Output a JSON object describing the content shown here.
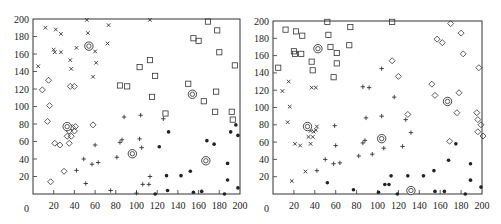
{
  "chart_data": [
    {
      "type": "scatter",
      "title": "",
      "xlabel": "",
      "ylabel": "",
      "xlim": [
        0,
        200
      ],
      "ylim": [
        0,
        200
      ],
      "xticks": [
        "0",
        "20",
        "40",
        "60",
        "80",
        "100",
        "120",
        "140",
        "160",
        "180",
        "200"
      ],
      "yticks": [
        "20",
        "40",
        "60",
        "80",
        "100",
        "120",
        "140",
        "160",
        "180",
        "200"
      ],
      "grid": false,
      "legend": null,
      "series": [
        {
          "name": "cluster-x",
          "marker": "x",
          "points": [
            [
              5,
              146
            ],
            [
              12,
              190
            ],
            [
              20,
              165
            ],
            [
              21,
              162
            ],
            [
              22,
              188
            ],
            [
              27,
              162
            ],
            [
              27,
              183
            ],
            [
              36,
              153
            ],
            [
              37,
              143
            ],
            [
              42,
              167
            ],
            [
              52,
              199
            ],
            [
              53,
              184
            ],
            [
              58,
              134
            ],
            [
              60,
              163
            ],
            [
              61,
              150
            ],
            [
              72,
              172
            ],
            [
              73,
              193
            ],
            [
              113,
              199
            ]
          ]
        },
        {
          "name": "cluster-diamond",
          "marker": "diamond",
          "points": [
            [
              9,
              119
            ],
            [
              15,
              130
            ],
            [
              14,
              83
            ],
            [
              16,
              101
            ],
            [
              17,
              14
            ],
            [
              21,
              58
            ],
            [
              26,
              56
            ],
            [
              30,
              26
            ],
            [
              33,
              66
            ],
            [
              35,
              58
            ],
            [
              35,
              72
            ],
            [
              36,
              123
            ],
            [
              37,
              66
            ],
            [
              38,
              76
            ],
            [
              40,
              123
            ],
            [
              40,
              72
            ],
            [
              41,
              77
            ],
            [
              58,
              79
            ]
          ]
        },
        {
          "name": "cluster-square",
          "marker": "square",
          "points": [
            [
              84,
              124
            ],
            [
              91,
              123
            ],
            [
              103,
              145
            ],
            [
              113,
              153
            ],
            [
              115,
              111
            ],
            [
              118,
              135
            ],
            [
              128,
              92
            ],
            [
              150,
              126
            ],
            [
              155,
              178
            ],
            [
              160,
              175
            ],
            [
              165,
              106
            ],
            [
              169,
              197
            ],
            [
              176,
              94
            ],
            [
              177,
              117
            ],
            [
              178,
              187
            ],
            [
              180,
              162
            ],
            [
              192,
              94
            ],
            [
              193,
              85
            ],
            [
              195,
              147
            ]
          ]
        },
        {
          "name": "cluster-plus",
          "marker": "plus",
          "points": [
            [
              42,
              27
            ],
            [
              49,
              40
            ],
            [
              51,
              12
            ],
            [
              57,
              34
            ],
            [
              60,
              56
            ],
            [
              63,
              36
            ],
            [
              75,
              4
            ],
            [
              81,
              42
            ],
            [
              84,
              59
            ],
            [
              86,
              62
            ],
            [
              88,
              88
            ],
            [
              100,
              1
            ],
            [
              103,
              63
            ],
            [
              104,
              90
            ],
            [
              105,
              53
            ],
            [
              106,
              11
            ],
            [
              112,
              11
            ],
            [
              113,
              20
            ],
            [
              126,
              86
            ]
          ]
        },
        {
          "name": "cluster-dot",
          "marker": "dot",
          "points": [
            [
              118,
              0
            ],
            [
              122,
              54
            ],
            [
              129,
              21
            ],
            [
              130,
              4
            ],
            [
              131,
              71
            ],
            [
              143,
              21
            ],
            [
              152,
              26
            ],
            [
              155,
              2
            ],
            [
              163,
              3
            ],
            [
              168,
              61
            ],
            [
              175,
              57
            ],
            [
              185,
              0
            ],
            [
              188,
              35
            ],
            [
              188,
              16
            ],
            [
              191,
              71
            ],
            [
              196,
              79
            ],
            [
              198,
              67
            ],
            [
              198,
              7
            ]
          ]
        },
        {
          "name": "centroids",
          "marker": "circled",
          "points": [
            [
              54,
              169
            ],
            [
              33,
              77
            ],
            [
              96,
              46
            ],
            [
              154,
              114
            ],
            [
              167,
              38
            ]
          ]
        }
      ]
    },
    {
      "type": "scatter",
      "title": "",
      "xlabel": "",
      "ylabel": "",
      "xlim": [
        0,
        200
      ],
      "ylim": [
        0,
        200
      ],
      "xticks": [
        "0",
        "20",
        "40",
        "60",
        "80",
        "100",
        "120",
        "140",
        "160",
        "180",
        "200"
      ],
      "yticks": [
        "20",
        "40",
        "60",
        "80",
        "100",
        "120",
        "140",
        "160",
        "180",
        "200"
      ],
      "grid": false,
      "legend": null,
      "series": [
        {
          "name": "cluster-square",
          "marker": "square",
          "points": [
            [
              5,
              146
            ],
            [
              12,
              190
            ],
            [
              20,
              165
            ],
            [
              21,
              162
            ],
            [
              22,
              188
            ],
            [
              27,
              162
            ],
            [
              28,
              183
            ],
            [
              37,
              153
            ],
            [
              38,
              143
            ],
            [
              52,
              199
            ],
            [
              53,
              184
            ],
            [
              55,
              170
            ],
            [
              58,
              135
            ],
            [
              61,
              163
            ],
            [
              61,
              151
            ],
            [
              73,
              172
            ],
            [
              74,
              193
            ],
            [
              114,
              199
            ]
          ]
        },
        {
          "name": "cluster-x",
          "marker": "x",
          "points": [
            [
              9,
              119
            ],
            [
              15,
              130
            ],
            [
              14,
              83
            ],
            [
              16,
              101
            ],
            [
              18,
              15
            ],
            [
              21,
              58
            ],
            [
              26,
              56
            ],
            [
              31,
              26
            ],
            [
              34,
              66
            ],
            [
              36,
              58
            ],
            [
              36,
              73
            ],
            [
              37,
              123
            ],
            [
              38,
              66
            ],
            [
              39,
              72
            ],
            [
              41,
              123
            ],
            [
              41,
              74
            ],
            [
              42,
              78
            ]
          ]
        },
        {
          "name": "cluster-plus",
          "marker": "plus",
          "points": [
            [
              42,
              27
            ],
            [
              50,
              40
            ],
            [
              58,
              35
            ],
            [
              59,
              79
            ],
            [
              60,
              56
            ],
            [
              64,
              36
            ],
            [
              82,
              44
            ],
            [
              86,
              59
            ],
            [
              86,
              124
            ],
            [
              88,
              62
            ],
            [
              89,
              88
            ],
            [
              92,
              123
            ],
            [
              95,
              46
            ],
            [
              104,
              145
            ],
            [
              104,
              90
            ],
            [
              106,
              53
            ],
            [
              116,
              112
            ],
            [
              124,
              55
            ],
            [
              127,
              86
            ],
            [
              132,
              71
            ]
          ]
        },
        {
          "name": "cluster-diamond",
          "marker": "diamond",
          "points": [
            [
              114,
              154
            ],
            [
              120,
              136
            ],
            [
              129,
              92
            ],
            [
              152,
              127
            ],
            [
              155,
              114
            ],
            [
              157,
              179
            ],
            [
              162,
              175
            ],
            [
              169,
              61
            ],
            [
              170,
              197
            ],
            [
              176,
              94
            ],
            [
              178,
              117
            ],
            [
              180,
              186
            ],
            [
              182,
              162
            ],
            [
              195,
              94
            ],
            [
              196,
              86
            ],
            [
              197,
              146
            ],
            [
              196,
              72
            ],
            [
              199,
              80
            ],
            [
              201,
              67
            ]
          ]
        },
        {
          "name": "cluster-dot",
          "marker": "dot",
          "points": [
            [
              52,
              13
            ],
            [
              77,
              5
            ],
            [
              101,
              2
            ],
            [
              107,
              11
            ],
            [
              111,
              11
            ],
            [
              113,
              21
            ],
            [
              119,
              0
            ],
            [
              129,
              21
            ],
            [
              144,
              21
            ],
            [
              154,
              27
            ],
            [
              155,
              3
            ],
            [
              164,
              3
            ],
            [
              168,
              39
            ],
            [
              175,
              58
            ],
            [
              184,
              0
            ],
            [
              189,
              35
            ],
            [
              189,
              16
            ],
            [
              199,
              8
            ]
          ]
        },
        {
          "name": "centroids",
          "marker": "circled",
          "points": [
            [
              43,
              168
            ],
            [
              33,
              78
            ],
            [
              104,
              64
            ],
            [
              167,
              107
            ],
            [
              132,
              4
            ]
          ]
        }
      ]
    }
  ],
  "charts": [
    {
      "id": "left-scatter",
      "frame": {
        "x0": 33,
        "x1": 240,
        "y0": 194,
        "y1": 19
      }
    },
    {
      "id": "right-scatter",
      "frame": {
        "x0": 273,
        "x1": 482,
        "y0": 194,
        "y1": 21
      }
    }
  ],
  "axis_zero_label": "0"
}
